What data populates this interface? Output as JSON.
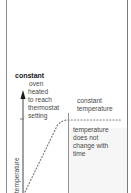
{
  "diagram": {
    "title": "constant",
    "y_axis_label": "temperature",
    "annotations": {
      "heating": [
        "oven",
        "heated",
        "to reach",
        "thermostat",
        "setting"
      ],
      "constant_label": [
        "constant",
        "temperature"
      ],
      "constant_desc": [
        "temperature",
        "does not",
        "change with",
        "time"
      ]
    },
    "colors": {
      "frame": "#8a8a8a",
      "axis": "#333333",
      "dots": "#888888",
      "shade": "#f6f6f6"
    }
  }
}
